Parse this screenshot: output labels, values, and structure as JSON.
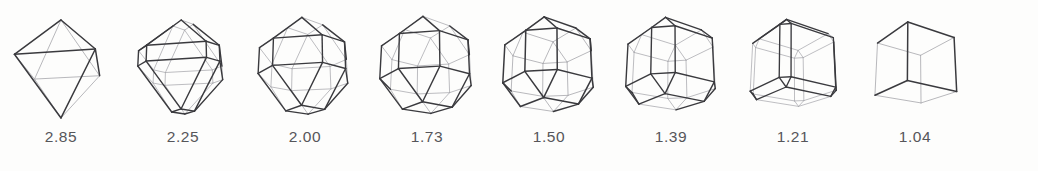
{
  "figure": {
    "kind": "polyhedron-morphology-series",
    "background_color": "#fdfdfc",
    "front_edge_color": "#3a3a3e",
    "back_edge_color": "#a9a9ae",
    "label_color": "#56565a",
    "count": 8
  },
  "shapes": [
    {
      "label": "2.85",
      "name": "octahedron",
      "truncation": 0.0,
      "scale": 1.0,
      "stroke_width": 1.5
    },
    {
      "label": "2.25",
      "name": "slightly-truncated-octahedron",
      "truncation": 0.17,
      "scale": 0.96,
      "stroke_width": 1.4
    },
    {
      "label": "2.00",
      "name": "truncated-octahedron",
      "truncation": 0.3,
      "scale": 0.99,
      "stroke_width": 1.4
    },
    {
      "label": "1.73",
      "name": "near-truncated-octahedron",
      "truncation": 0.4,
      "scale": 1.0,
      "stroke_width": 1.4
    },
    {
      "label": "1.50",
      "name": "cuboctahedron",
      "truncation": 0.5,
      "scale": 1.0,
      "stroke_width": 1.5
    },
    {
      "label": "1.39",
      "name": "truncated-cube-intermediate",
      "truncation": 0.6,
      "scale": 1.0,
      "stroke_width": 1.4
    },
    {
      "label": "1.21",
      "name": "slightly-truncated-cube",
      "truncation": 0.78,
      "scale": 1.0,
      "stroke_width": 1.35
    },
    {
      "label": "1.04",
      "name": "cube",
      "truncation": 1.0,
      "scale": 1.0,
      "stroke_width": 1.5
    }
  ],
  "labels_row": [
    "2.85",
    "2.25",
    "2.00",
    "1.73",
    "1.50",
    "1.39",
    "1.21",
    "1.04"
  ],
  "chart_data": {
    "type": "table",
    "title": "",
    "categories": [
      "octahedron",
      "slightly-truncated-octahedron",
      "truncated-octahedron",
      "near-truncated-octahedron",
      "cuboctahedron",
      "truncated-cube-intermediate",
      "slightly-truncated-cube",
      "cube"
    ],
    "values": [
      2.85,
      2.25,
      2.0,
      1.73,
      1.5,
      1.39,
      1.21,
      1.04
    ],
    "xlabel": "",
    "ylabel": "",
    "legend": []
  }
}
